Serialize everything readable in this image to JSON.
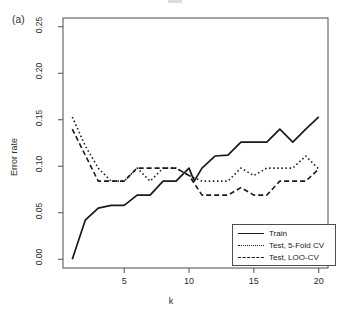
{
  "panel": {
    "label": "(a)"
  },
  "chart_data": {
    "type": "line",
    "title": "",
    "xlabel": "k",
    "ylabel": "Error rate",
    "xlim": [
      1,
      20
    ],
    "ylim": [
      0.0,
      0.25
    ],
    "grid": false,
    "legend_position": "bottom-right",
    "x": [
      1,
      2,
      3,
      4,
      5,
      6,
      7,
      8,
      9,
      10,
      11,
      12,
      13,
      14,
      15,
      16,
      17,
      18,
      19,
      20
    ],
    "xticks": [
      5,
      10,
      15,
      20
    ],
    "xtick_labels": [
      "5",
      "10",
      "15",
      "20"
    ],
    "yticks": [
      0.0,
      0.05,
      0.1,
      0.15,
      0.2,
      0.25
    ],
    "ytick_labels": [
      "0.00",
      "0.05",
      "0.10",
      "0.15",
      "0.20",
      "0.25"
    ],
    "series": [
      {
        "name": "Train",
        "style": "solid",
        "color": "#1a1a1a",
        "values": [
          0.0,
          0.042,
          0.055,
          0.058,
          0.058,
          0.069,
          0.069,
          0.069,
          0.084,
          0.084,
          0.084,
          0.084,
          0.098,
          0.084,
          0.098,
          0.111,
          0.112,
          0.126,
          0.126,
          0.126
        ]
      },
      {
        "name": "Test, 5-Fold CV",
        "style": "dotted",
        "color": "#1a1a1a",
        "values": [
          0.153,
          0.122,
          0.098,
          0.084,
          0.084,
          0.098,
          0.084,
          0.098,
          0.098,
          0.09,
          0.084,
          0.084,
          0.084,
          0.084,
          0.098,
          0.09,
          0.098,
          0.098,
          0.111,
          0.097
        ]
      },
      {
        "name": "Test, LOO-CV",
        "style": "dashed",
        "color": "#1a1a1a",
        "values": [
          0.14,
          0.112,
          0.084,
          0.084,
          0.084,
          0.098,
          0.098,
          0.098,
          0.098,
          0.09,
          0.069,
          0.069,
          0.069,
          0.077,
          0.069,
          0.069,
          0.084,
          0.084,
          0.084,
          0.097
        ]
      }
    ],
    "train_points": [
      [
        1,
        0.0
      ],
      [
        2,
        0.042
      ],
      [
        3,
        0.055
      ],
      [
        4,
        0.058
      ],
      [
        5,
        0.058
      ],
      [
        6,
        0.069
      ],
      [
        7,
        0.069
      ],
      [
        8,
        0.084
      ],
      [
        9,
        0.084
      ],
      [
        10,
        0.098
      ],
      [
        10.4,
        0.084
      ],
      [
        11,
        0.098
      ],
      [
        12,
        0.111
      ],
      [
        13,
        0.112
      ],
      [
        14,
        0.126
      ],
      [
        15,
        0.126
      ],
      [
        16,
        0.126
      ],
      [
        17,
        0.14
      ],
      [
        18,
        0.126
      ],
      [
        19,
        0.14
      ],
      [
        20,
        0.153
      ]
    ],
    "fivefold_points": [
      [
        1,
        0.153
      ],
      [
        2,
        0.122
      ],
      [
        3,
        0.098
      ],
      [
        4,
        0.084
      ],
      [
        5,
        0.084
      ],
      [
        6,
        0.098
      ],
      [
        7,
        0.084
      ],
      [
        8,
        0.098
      ],
      [
        9,
        0.098
      ],
      [
        10,
        0.09
      ],
      [
        11,
        0.084
      ],
      [
        12,
        0.084
      ],
      [
        13,
        0.084
      ],
      [
        14,
        0.098
      ],
      [
        15,
        0.09
      ],
      [
        16,
        0.098
      ],
      [
        17,
        0.098
      ],
      [
        18,
        0.098
      ],
      [
        19,
        0.111
      ],
      [
        20,
        0.097
      ]
    ],
    "loocv_points": [
      [
        1,
        0.14
      ],
      [
        2,
        0.112
      ],
      [
        3,
        0.084
      ],
      [
        4,
        0.084
      ],
      [
        5,
        0.084
      ],
      [
        6,
        0.098
      ],
      [
        7,
        0.098
      ],
      [
        8,
        0.098
      ],
      [
        9,
        0.098
      ],
      [
        10,
        0.09
      ],
      [
        11,
        0.069
      ],
      [
        12,
        0.069
      ],
      [
        13,
        0.069
      ],
      [
        14,
        0.077
      ],
      [
        15,
        0.069
      ],
      [
        16,
        0.069
      ],
      [
        17,
        0.084
      ],
      [
        18,
        0.084
      ],
      [
        19,
        0.084
      ],
      [
        20,
        0.097
      ]
    ]
  },
  "legend": {
    "items": [
      {
        "label": "Train",
        "style": "solid"
      },
      {
        "label": "Test, 5-Fold CV",
        "style": "dotted"
      },
      {
        "label": "Test, LOO-CV",
        "style": "dashed"
      }
    ]
  }
}
